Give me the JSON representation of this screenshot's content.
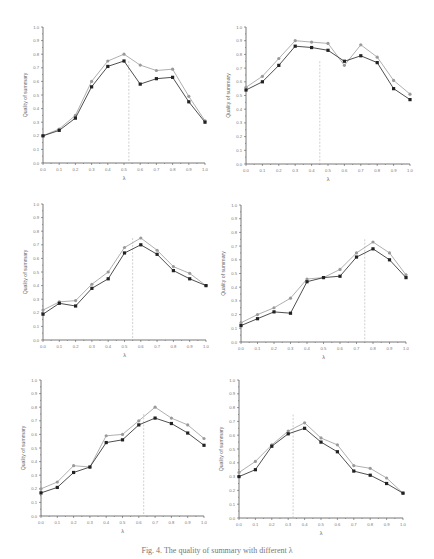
{
  "chart_data": [
    {
      "type": "line",
      "title": "",
      "xlabel": "λ",
      "ylabel": "Quality of summary",
      "xlim": [
        0.0,
        1.0
      ],
      "ylim": [
        0.0,
        1.0
      ],
      "x": [
        0.0,
        0.1,
        0.2,
        0.3,
        0.4,
        0.5,
        0.6,
        0.7,
        0.8,
        0.9,
        1.0
      ],
      "xticks": [
        "0.0",
        "0.1",
        "0.2",
        "0.3",
        "0.4",
        "0.5",
        "0.6",
        "0.7",
        "0.8",
        "0.9",
        "1.0"
      ],
      "yticks": [
        "0.0",
        "0.1",
        "0.2",
        "0.3",
        "0.4",
        "0.5",
        "0.6",
        "0.7",
        "0.8",
        "0.9",
        "1.0"
      ],
      "series": [
        {
          "name": "upper (circle markers)",
          "values": [
            0.2,
            0.25,
            0.35,
            0.6,
            0.75,
            0.8,
            0.72,
            0.68,
            0.69,
            0.49,
            0.31
          ]
        },
        {
          "name": "lower (square markers)",
          "values": [
            0.2,
            0.24,
            0.33,
            0.56,
            0.71,
            0.75,
            0.58,
            0.62,
            0.63,
            0.45,
            0.3
          ]
        }
      ],
      "vline": 0.53,
      "grid": false
    },
    {
      "type": "line",
      "title": "",
      "xlabel": "λ",
      "ylabel": "Quality of summary",
      "xlim": [
        0.0,
        1.0
      ],
      "ylim": [
        0.0,
        1.0
      ],
      "x": [
        0.0,
        0.1,
        0.2,
        0.3,
        0.4,
        0.5,
        0.6,
        0.7,
        0.8,
        0.9,
        1.0
      ],
      "xticks": [
        "0.0",
        "0.1",
        "0.2",
        "0.3",
        "0.4",
        "0.5",
        "0.6",
        "0.7",
        "0.8",
        "0.9",
        "1.0"
      ],
      "yticks": [
        "0.0",
        "0.1",
        "0.2",
        "0.3",
        "0.4",
        "0.5",
        "0.6",
        "0.7",
        "0.8",
        "0.9",
        "1.0"
      ],
      "series": [
        {
          "name": "upper (circle markers)",
          "values": [
            0.56,
            0.64,
            0.77,
            0.9,
            0.89,
            0.88,
            0.72,
            0.87,
            0.78,
            0.61,
            0.51
          ]
        },
        {
          "name": "lower (square markers)",
          "values": [
            0.54,
            0.6,
            0.72,
            0.86,
            0.85,
            0.83,
            0.75,
            0.79,
            0.74,
            0.55,
            0.47
          ]
        }
      ],
      "vline": 0.45,
      "grid": false
    },
    {
      "type": "line",
      "title": "",
      "xlabel": "λ",
      "ylabel": "Quality of summary",
      "xlim": [
        0.0,
        1.0
      ],
      "ylim": [
        0.0,
        1.0
      ],
      "x": [
        0.0,
        0.1,
        0.2,
        0.3,
        0.4,
        0.5,
        0.6,
        0.7,
        0.8,
        0.9,
        1.0
      ],
      "xticks": [
        "0.0",
        "0.1",
        "0.2",
        "0.3",
        "0.4",
        "0.5",
        "0.6",
        "0.7",
        "0.8",
        "0.9",
        "1.0"
      ],
      "yticks": [
        "0.0",
        "0.1",
        "0.2",
        "0.3",
        "0.4",
        "0.5",
        "0.6",
        "0.7",
        "0.8",
        "0.9",
        "1.0"
      ],
      "series": [
        {
          "name": "upper (circle markers)",
          "values": [
            0.22,
            0.28,
            0.29,
            0.41,
            0.5,
            0.68,
            0.75,
            0.66,
            0.54,
            0.49,
            0.4
          ]
        },
        {
          "name": "lower (square markers)",
          "values": [
            0.19,
            0.27,
            0.25,
            0.38,
            0.45,
            0.64,
            0.7,
            0.63,
            0.51,
            0.45,
            0.4
          ]
        }
      ],
      "vline": 0.55,
      "grid": false
    },
    {
      "type": "line",
      "title": "",
      "xlabel": "λ",
      "ylabel": "Quality of summary",
      "xlim": [
        0.0,
        1.0
      ],
      "ylim": [
        0.0,
        1.0
      ],
      "x": [
        0.0,
        0.1,
        0.2,
        0.3,
        0.4,
        0.5,
        0.6,
        0.7,
        0.8,
        0.9,
        1.0
      ],
      "xticks": [
        "0.0",
        "0.1",
        "0.2",
        "0.3",
        "0.4",
        "0.5",
        "0.6",
        "0.7",
        "0.8",
        "0.9",
        "1.0"
      ],
      "yticks": [
        "0.0",
        "0.1",
        "0.2",
        "0.3",
        "0.4",
        "0.5",
        "0.6",
        "0.7",
        "0.8",
        "0.9",
        "1.0"
      ],
      "series": [
        {
          "name": "upper (circle markers)",
          "values": [
            0.14,
            0.2,
            0.25,
            0.32,
            0.46,
            0.47,
            0.53,
            0.65,
            0.73,
            0.65,
            0.49
          ]
        },
        {
          "name": "lower (square markers)",
          "values": [
            0.12,
            0.17,
            0.22,
            0.21,
            0.44,
            0.47,
            0.48,
            0.62,
            0.68,
            0.6,
            0.47
          ]
        }
      ],
      "vline": 0.75,
      "grid": false
    },
    {
      "type": "line",
      "title": "",
      "xlabel": "λ",
      "ylabel": "Quality of summary",
      "xlim": [
        0.0,
        1.0
      ],
      "ylim": [
        0.0,
        1.0
      ],
      "x": [
        0.0,
        0.1,
        0.2,
        0.3,
        0.4,
        0.5,
        0.6,
        0.7,
        0.8,
        0.9,
        1.0
      ],
      "xticks": [
        "0.0",
        "0.1",
        "0.2",
        "0.3",
        "0.4",
        "0.5",
        "0.6",
        "0.7",
        "0.8",
        "0.9",
        "1.0"
      ],
      "yticks": [
        "0.0",
        "0.1",
        "0.2",
        "0.3",
        "0.4",
        "0.5",
        "0.6",
        "0.7",
        "0.8",
        "0.9",
        "1.0"
      ],
      "series": [
        {
          "name": "upper (circle markers)",
          "values": [
            0.2,
            0.25,
            0.37,
            0.36,
            0.59,
            0.6,
            0.7,
            0.8,
            0.72,
            0.67,
            0.57
          ]
        },
        {
          "name": "lower (square markers)",
          "values": [
            0.17,
            0.21,
            0.32,
            0.36,
            0.54,
            0.56,
            0.67,
            0.72,
            0.68,
            0.61,
            0.52
          ]
        }
      ],
      "vline": 0.63,
      "grid": false
    },
    {
      "type": "line",
      "title": "",
      "xlabel": "λ",
      "ylabel": "Quality of summary",
      "xlim": [
        0.0,
        1.0
      ],
      "ylim": [
        0.0,
        1.0
      ],
      "x": [
        0.0,
        0.1,
        0.2,
        0.3,
        0.4,
        0.5,
        0.6,
        0.7,
        0.8,
        0.9,
        1.0
      ],
      "xticks": [
        "0.0",
        "0.1",
        "0.2",
        "0.3",
        "0.4",
        "0.5",
        "0.6",
        "0.7",
        "0.8",
        "0.9",
        "1.0"
      ],
      "yticks": [
        "0.0",
        "0.1",
        "0.2",
        "0.3",
        "0.4",
        "0.5",
        "0.6",
        "0.7",
        "0.8",
        "0.9",
        "1.0"
      ],
      "series": [
        {
          "name": "upper (circle markers)",
          "values": [
            0.33,
            0.41,
            0.53,
            0.63,
            0.69,
            0.58,
            0.53,
            0.38,
            0.36,
            0.29,
            0.18
          ]
        },
        {
          "name": "lower (square markers)",
          "values": [
            0.3,
            0.35,
            0.52,
            0.61,
            0.65,
            0.55,
            0.48,
            0.34,
            0.31,
            0.25,
            0.18
          ]
        }
      ],
      "vline": 0.33,
      "grid": false
    }
  ],
  "layout": {
    "panels": [
      {
        "x0": 43,
        "x1": 205,
        "ytop": 27,
        "ybot": 163
      },
      {
        "x0": 246,
        "x1": 410,
        "ytop": 27,
        "ybot": 164
      },
      {
        "x0": 43,
        "x1": 206,
        "ytop": 204,
        "ybot": 340
      },
      {
        "x0": 241,
        "x1": 406,
        "ytop": 205,
        "ybot": 342
      },
      {
        "x0": 41,
        "x1": 204,
        "ytop": 380,
        "ybot": 516
      },
      {
        "x0": 239,
        "x1": 403,
        "ytop": 380,
        "ybot": 518
      }
    ],
    "colors": {
      "upper": "#9a9a9a",
      "lower": "#222222",
      "axis": "#555555",
      "vline": "#b0b0b0"
    }
  },
  "caption": "Fig. 4. The quality of summary with different λ"
}
